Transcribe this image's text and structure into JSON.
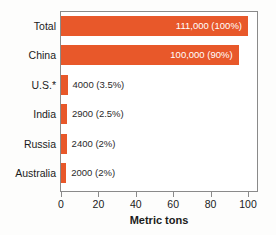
{
  "chart_data": {
    "type": "bar",
    "orientation": "horizontal",
    "title": "",
    "xlabel": "Metric tons",
    "ylabel": "",
    "xlim": [
      0,
      110
    ],
    "xticks": [
      0,
      20,
      40,
      60,
      80,
      100
    ],
    "grid": false,
    "legend": null,
    "bar_color": "#e8582a",
    "categories": [
      "Total",
      "China",
      "U.S.*",
      "India",
      "Russia",
      "Australia"
    ],
    "values": [
      111000,
      100000,
      4000,
      2900,
      2400,
      2000
    ],
    "percentages": [
      "100%",
      "90%",
      "3.5%",
      "2.5%",
      "2%",
      "2%"
    ],
    "bars": [
      {
        "category": "Total",
        "value": 111000,
        "percent": "100%",
        "label": "111,000 (100%)",
        "bar_units": 100,
        "label_inside": true
      },
      {
        "category": "China",
        "value": 100000,
        "percent": "90%",
        "label": "100,000 (90%)",
        "bar_units": 95,
        "label_inside": true
      },
      {
        "category": "U.S.*",
        "value": 4000,
        "percent": "3.5%",
        "label": "4000 (3.5%)",
        "bar_units": 3.5,
        "label_inside": false
      },
      {
        "category": "India",
        "value": 2900,
        "percent": "2.5%",
        "label": "2900 (2.5%)",
        "bar_units": 3.2,
        "label_inside": false
      },
      {
        "category": "Russia",
        "value": 2400,
        "percent": "2%",
        "label": "2400 (2%)",
        "bar_units": 3.0,
        "label_inside": false
      },
      {
        "category": "Australia",
        "value": 2000,
        "percent": "2%",
        "label": "2000 (2%)",
        "bar_units": 2.8,
        "label_inside": false
      }
    ],
    "axis": {
      "ticks": [
        {
          "value": 0,
          "label": "0"
        },
        {
          "value": 20,
          "label": "20"
        },
        {
          "value": 40,
          "label": "40"
        },
        {
          "value": 60,
          "label": "60"
        },
        {
          "value": 80,
          "label": "80"
        },
        {
          "value": 100,
          "label": "100"
        }
      ]
    }
  }
}
